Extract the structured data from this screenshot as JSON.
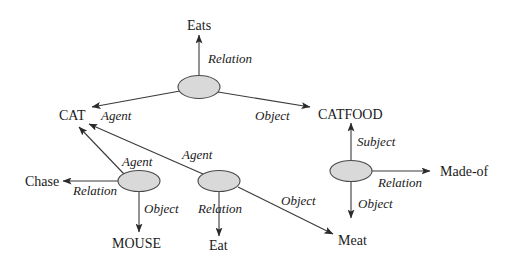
{
  "diagram": {
    "type": "semantic-network",
    "colors": {
      "node_fill": "#d9d9d9",
      "stroke": "#3a3a3a",
      "text": "#1a1a1a"
    },
    "concepts": {
      "eats": "Eats",
      "cat": "CAT",
      "catfood": "CATFOOD",
      "chase": "Chase",
      "mouse": "MOUSE",
      "eat": "Eat",
      "meat": "Meat",
      "made_of": "Made-of"
    },
    "edge_labels": {
      "top_relation": "Relation",
      "top_agent": "Agent",
      "top_object": "Object",
      "chase_agent": "Agent",
      "chase_relation": "Relation",
      "chase_object": "Object",
      "eat_agent": "Agent",
      "eat_relation": "Relation",
      "eat_object": "Object",
      "madeof_subject": "Subject",
      "madeof_relation": "Relation",
      "madeof_object": "Object"
    },
    "nodes": [
      {
        "id": "n1",
        "edges": [
          {
            "label": "Relation",
            "to": "Eats"
          },
          {
            "label": "Agent",
            "to": "CAT"
          },
          {
            "label": "Object",
            "to": "CATFOOD"
          }
        ]
      },
      {
        "id": "n2",
        "edges": [
          {
            "label": "Agent",
            "to": "CAT"
          },
          {
            "label": "Relation",
            "to": "Chase"
          },
          {
            "label": "Object",
            "to": "MOUSE"
          }
        ]
      },
      {
        "id": "n3",
        "edges": [
          {
            "label": "Agent",
            "to": "CAT"
          },
          {
            "label": "Relation",
            "to": "Eat"
          },
          {
            "label": "Object",
            "to": "Meat"
          }
        ]
      },
      {
        "id": "n4",
        "edges": [
          {
            "label": "Subject",
            "to": "CATFOOD"
          },
          {
            "label": "Relation",
            "to": "Made-of"
          },
          {
            "label": "Object",
            "to": "Meat"
          }
        ]
      }
    ]
  }
}
